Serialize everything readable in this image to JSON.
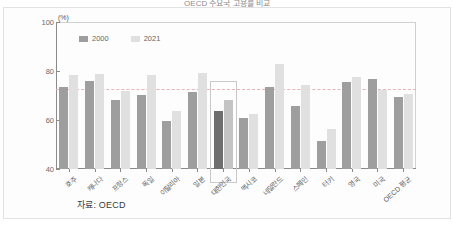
{
  "title": "OECD 주요국 고용률 비교",
  "figure": {
    "unit_label": "(%)",
    "source_note": "자료: OECD"
  },
  "legend": {
    "position": "top-left",
    "entries": [
      {
        "label": "2000",
        "color": "#9e9e9e"
      },
      {
        "label": "2021",
        "color": "#e0e0e0"
      }
    ]
  },
  "colors": {
    "series_2000": "#9e9e9e",
    "series_2021": "#e0e0e0",
    "series_2000_highlight": "#6e6e6e",
    "series_2021_highlight": "#c4c4c4",
    "axis": "#8a8a8a",
    "ref_line": "#e8b3b3",
    "highlight_border": "#c9c9c9",
    "background": "#fdfdfd"
  },
  "axis": {
    "y_ticks": [
      "100",
      "80",
      "60",
      "40"
    ],
    "y_tick_values": [
      100,
      80,
      60,
      40
    ],
    "ylim": [
      40,
      100
    ],
    "xlabel": "",
    "ylabel": "(%)"
  },
  "reference_line": {
    "value": 72.5,
    "style": "dashed"
  },
  "highlight": {
    "category": "대한민국",
    "index": 6,
    "top_value": 76
  },
  "chart_data": {
    "type": "bar",
    "title": "OECD 주요국 고용률 비교",
    "xlabel": "",
    "ylabel": "(%)",
    "ylim": [
      40,
      100
    ],
    "grid": false,
    "legend_position": "top-left",
    "categories": [
      "호주",
      "캐나다",
      "프랑스",
      "독일",
      "이탈리아",
      "일본",
      "대한민국",
      "멕시코",
      "네덜란드",
      "스페인",
      "터키",
      "영국",
      "미국",
      "OECD 평균"
    ],
    "series": [
      {
        "name": "2000",
        "values": [
          73.5,
          75.8,
          68.3,
          70.3,
          59.6,
          71.4,
          63.6,
          61.0,
          73.3,
          65.8,
          51.4,
          75.6,
          76.7,
          69.2
        ]
      },
      {
        "name": "2021",
        "values": [
          78.5,
          78.7,
          72.0,
          78.5,
          63.8,
          79.0,
          68.3,
          62.5,
          82.7,
          74.2,
          56.5,
          77.6,
          72.1,
          70.8
        ]
      }
    ],
    "annotations": [
      {
        "type": "reference-line",
        "value": 72.5,
        "orientation": "horizontal"
      },
      {
        "type": "highlight-box",
        "category": "대한민국"
      }
    ]
  }
}
